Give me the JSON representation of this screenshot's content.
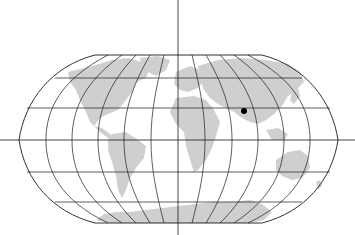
{
  "map": {
    "projection": "robinson-like pseudocylindrical world map",
    "colors": {
      "background": "#ffffff",
      "land": "#cfcfcf",
      "grid": "#1a1a1a",
      "marker": "#000000"
    },
    "axes": {
      "equator_y": 140,
      "central_meridian_x": 178
    },
    "marker": {
      "label": "",
      "x": 244,
      "y": 111,
      "radius": 3
    }
  }
}
